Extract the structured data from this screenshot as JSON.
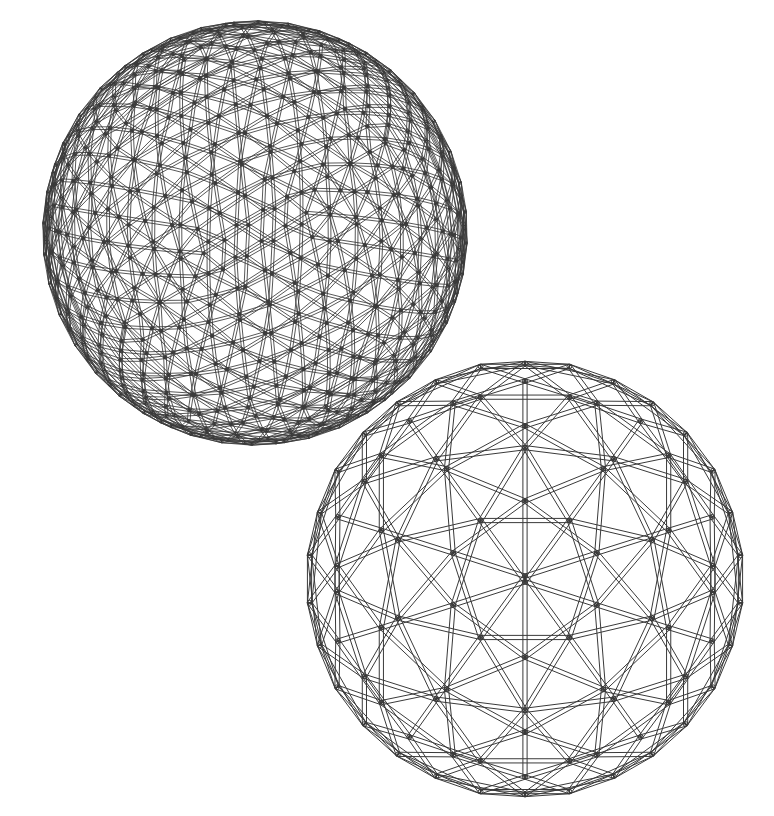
{
  "document": {
    "title": "Geodesic Sphere Structures",
    "background_color": "#ffffff",
    "line_color": "#3a3a3a",
    "width": 774,
    "height": 816,
    "style": "technical line drawing, wireframe strut outlines, no fill, no text labels"
  },
  "figures": [
    {
      "id": "high-frequency-geodesic-sphere",
      "name": "Geodesic sphere, high frequency",
      "position": "top-left",
      "center_x": 255,
      "center_y": 233,
      "radius": 211,
      "silhouette": "circle",
      "frequency": 8,
      "base_polyhedron": "icosahedron",
      "hub_count_visible": 26,
      "strut_render": "double-line tube outline",
      "line_color": "#3a3a3a",
      "stroke_width": 0.85,
      "description": "Dense triangulated geodesic sphere drawn in orthographic projection; struts compress toward the silhouette producing dashed-looking edges."
    },
    {
      "id": "low-frequency-geodesic-polyhedron",
      "name": "Geodesic polyhedron, low frequency",
      "position": "bottom-right",
      "center_x": 525,
      "center_y": 579,
      "radius": 220,
      "silhouette": "hexagon",
      "frequency": 3,
      "base_polyhedron": "icosahedron",
      "strut_render": "double-line tube outline",
      "line_color": "#3a3a3a",
      "stroke_width": 1.0,
      "description": "Three-frequency icosahedral geodesic polyhedron viewed down a three-fold axis, giving a hexagonal outline with triangulated faces and visible rear struts."
    }
  ],
  "chart_data": {
    "type": "diagram",
    "title": "Geodesic sphere structures",
    "items": [
      {
        "label": "High frequency geodesic sphere",
        "frequency": 8,
        "radius_px": 211
      },
      {
        "label": "Low frequency geodesic polyhedron",
        "frequency": 3,
        "radius_px": 220
      }
    ]
  }
}
